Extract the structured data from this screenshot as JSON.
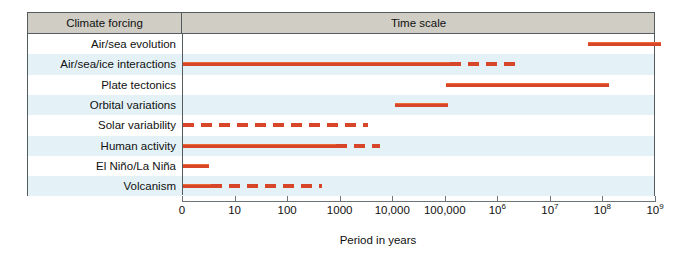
{
  "chart_data": {
    "type": "bar",
    "xlabel": "Period in years",
    "ylabel": "Climate forcing",
    "grid": false,
    "legend": "none",
    "x_scale": "log",
    "xlim": [
      1,
      1000000000
    ],
    "x_tick_labels": [
      "0",
      "10",
      "100",
      "1000",
      "10,000",
      "100,000",
      "10⁶",
      "10⁷",
      "10⁸",
      "10⁹"
    ],
    "x_tick_values": [
      1,
      10,
      100,
      1000,
      10000,
      100000,
      1000000,
      10000000,
      100000000,
      1000000000
    ],
    "bar_color": "#d8462a",
    "categories": [
      "Air/sea evolution",
      "Air/sea/ice interactions",
      "Plate tectonics",
      "Orbital variations",
      "Solar variability",
      "Human activity",
      "El Niño/La Niña",
      "Volcanism"
    ],
    "series": [
      {
        "name": "Air/sea evolution",
        "segments": [
          {
            "start_decade": 7.71,
            "end_decade": 9.09,
            "style": "solid"
          }
        ]
      },
      {
        "name": "Air/sea/ice interactions",
        "segments": [
          {
            "start_decade": 0.0,
            "end_decade": 5.08,
            "style": "solid"
          },
          {
            "start_decade": 5.08,
            "end_decade": 6.46,
            "style": "dashed"
          }
        ]
      },
      {
        "name": "Plate tectonics",
        "segments": [
          {
            "start_decade": 5.0,
            "end_decade": 8.11,
            "style": "solid"
          }
        ]
      },
      {
        "name": "Orbital variations",
        "segments": [
          {
            "start_decade": 4.04,
            "end_decade": 5.04,
            "style": "solid"
          }
        ]
      },
      {
        "name": "Solar variability",
        "segments": [
          {
            "start_decade": 0.0,
            "end_decade": 3.52,
            "style": "dashed"
          }
        ]
      },
      {
        "name": "Human activity",
        "segments": [
          {
            "start_decade": 0.0,
            "end_decade": 2.92,
            "style": "solid"
          },
          {
            "start_decade": 2.92,
            "end_decade": 3.75,
            "style": "dashed"
          }
        ]
      },
      {
        "name": "El Niño/La Niña",
        "segments": [
          {
            "start_decade": 0.0,
            "end_decade": 0.5,
            "style": "solid"
          }
        ]
      },
      {
        "name": "Volcanism",
        "segments": [
          {
            "start_decade": 0.0,
            "end_decade": 0.54,
            "style": "solid"
          },
          {
            "start_decade": 0.54,
            "end_decade": 2.65,
            "style": "dashed"
          }
        ]
      }
    ]
  },
  "header": {
    "left_label": "Climate forcing",
    "right_label": "Time scale"
  },
  "rows": [
    {
      "label": "Air/sea evolution"
    },
    {
      "label": "Air/sea/ice interactions"
    },
    {
      "label": "Plate tectonics"
    },
    {
      "label": "Orbital variations"
    },
    {
      "label": "Solar variability"
    },
    {
      "label": "Human activity"
    },
    {
      "label": "El Niño/La Niña"
    },
    {
      "label": "Volcanism"
    }
  ],
  "axis": {
    "title": "Period in years",
    "ticks": [
      {
        "label": "0",
        "sup": ""
      },
      {
        "label": "10",
        "sup": ""
      },
      {
        "label": "100",
        "sup": ""
      },
      {
        "label": "1000",
        "sup": ""
      },
      {
        "label": "10,000",
        "sup": ""
      },
      {
        "label": "100,000",
        "sup": ""
      },
      {
        "label": "10",
        "sup": "6"
      },
      {
        "label": "10",
        "sup": "7"
      },
      {
        "label": "10",
        "sup": "8"
      },
      {
        "label": "10",
        "sup": "9"
      }
    ]
  },
  "colors": {
    "bar": "#d8462a",
    "bar_highlight": "#ec6a35",
    "header_band": "#cfcdc4",
    "row_stripe": "#e4f2f7",
    "frame": "#555c60"
  }
}
